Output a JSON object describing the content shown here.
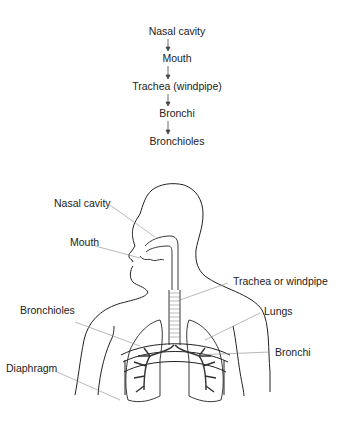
{
  "flowchart": {
    "steps": [
      "Nasal cavity",
      "Mouth",
      "Trachea (windpipe)",
      "Bronchi",
      "Bronchioles"
    ]
  },
  "diagram": {
    "labels": {
      "nasal_cavity": "Nasal cavity",
      "mouth": "Mouth",
      "trachea": "Trachea or windpipe",
      "bronchioles": "Bronchioles",
      "lungs": "Lungs",
      "bronchi": "Bronchi",
      "diaphragm": "Diaphragm"
    }
  }
}
